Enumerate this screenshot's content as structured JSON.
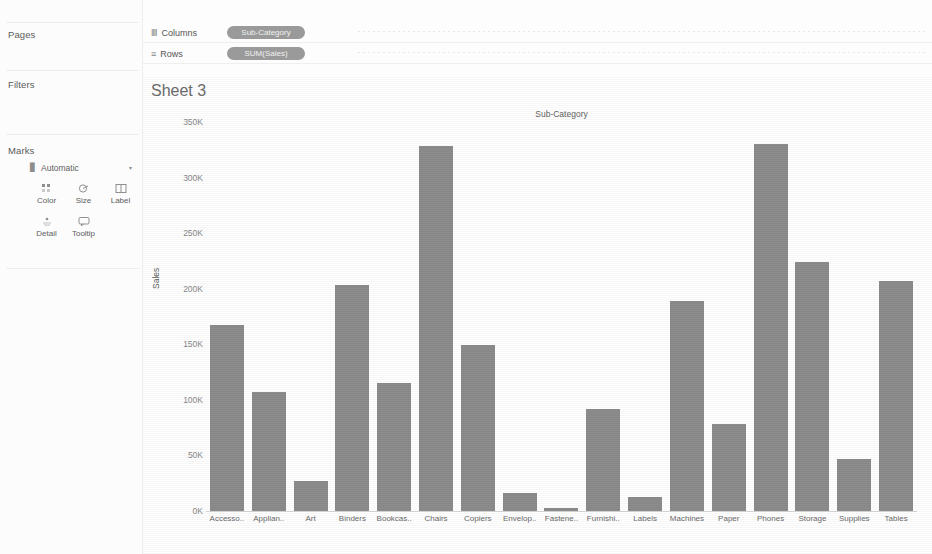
{
  "left_panel": {
    "pages_card": {
      "title": "Pages"
    },
    "filters_card": {
      "title": "Filters"
    },
    "marks_card": {
      "title": "Marks",
      "type_selector": {
        "label": "Automatic",
        "icon": "bar-mark-icon",
        "caret": "▾"
      },
      "buttons": [
        {
          "name": "color",
          "label": "Color",
          "glyph": "∷"
        },
        {
          "name": "size",
          "label": "Size",
          "glyph": "◯"
        },
        {
          "name": "label",
          "label": "Label",
          "glyph": "▧"
        },
        {
          "name": "detail",
          "label": "Detail",
          "glyph": "∴"
        },
        {
          "name": "tooltip",
          "label": "Tooltip",
          "glyph": "⬜"
        }
      ]
    }
  },
  "shelves": [
    {
      "name": "columns",
      "label": "Columns",
      "icon": "‖‖",
      "pill": "Sub-Category"
    },
    {
      "name": "rows",
      "label": "Rows",
      "icon": "≡",
      "pill": "SUM(Sales)"
    }
  ],
  "view": {
    "sheet_title": "Sheet 3",
    "column_header": "Sub-Category"
  },
  "colors": {
    "bar": "#8c8c8c",
    "pill": "#9a9a9a",
    "axis_text": "#888888",
    "panel_bg": "#fcfcfc"
  },
  "chart_data": {
    "type": "bar",
    "title": "Sheet 3",
    "xlabel": "Sub-Category",
    "ylabel": "Sales",
    "ylim": [
      0,
      350000
    ],
    "ytick_labels": [
      "0K",
      "50K",
      "100K",
      "150K",
      "200K",
      "250K",
      "300K",
      "350K"
    ],
    "ytick_values": [
      0,
      50000,
      100000,
      150000,
      200000,
      250000,
      300000,
      350000
    ],
    "grid": false,
    "legend": "none",
    "categories": [
      "Accesso..",
      "Applian..",
      "Art",
      "Binders",
      "Bookcas..",
      "Chairs",
      "Copiers",
      "Envelop..",
      "Fastene..",
      "Furnishi..",
      "Labels",
      "Machines",
      "Paper",
      "Phones",
      "Storage",
      "Supplies",
      "Tables"
    ],
    "values": [
      167380,
      107532,
      27119,
      203413,
      114880,
      328449,
      149528,
      16476,
      3024,
      91705,
      12486,
      189239,
      78479,
      330007,
      223844,
      46674,
      206966
    ]
  }
}
